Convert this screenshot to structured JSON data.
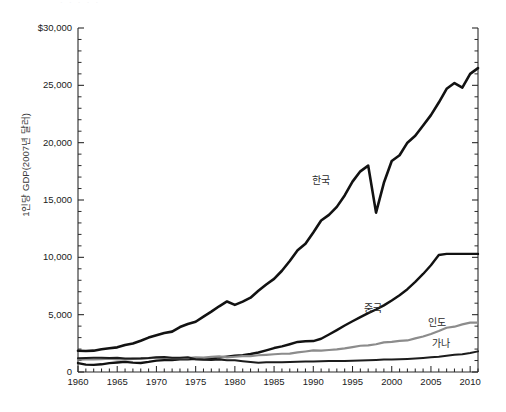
{
  "figure": {
    "cropped_top_text": "· · · · ·",
    "ylabel": "1인당 GDP(2007년 달러)"
  },
  "axes": {
    "y_ticks": [
      "$30,000",
      "25,000",
      "20,000",
      "15,000",
      "10,000",
      "5,000",
      "0"
    ],
    "y_tick_values": [
      30000,
      25000,
      20000,
      15000,
      10000,
      5000,
      0
    ],
    "x_ticks": [
      "1960",
      "1965",
      "1970",
      "1975",
      "1980",
      "1985",
      "1990",
      "1995",
      "2000",
      "2005",
      "2010"
    ],
    "x_tick_values": [
      1960,
      1965,
      1970,
      1975,
      1980,
      1985,
      1990,
      1995,
      2000,
      2005,
      2010
    ]
  },
  "series_labels": [
    {
      "name": "korea",
      "text": "한국",
      "x": 312,
      "y": 172
    },
    {
      "name": "china",
      "text": "중국",
      "x": 364,
      "y": 300
    },
    {
      "name": "india",
      "text": "인도",
      "x": 428,
      "y": 314
    },
    {
      "name": "ghana",
      "text": "가나",
      "x": 432,
      "y": 335
    }
  ],
  "colors": {
    "korea": "#121212",
    "china": "#121212",
    "india": "#8c8c8c",
    "ghana": "#1c1c1c",
    "axis": "#2a2a2a",
    "text": "#1a1a1a",
    "background": "#ffffff"
  },
  "chart_data": {
    "type": "line",
    "title": "",
    "xlabel": "",
    "ylabel": "1인당 GDP(2007년 달러)",
    "xlim": [
      1960,
      2011
    ],
    "ylim": [
      0,
      30000
    ],
    "grid": false,
    "legend": "inline-annotations",
    "x": [
      1960,
      1961,
      1962,
      1963,
      1964,
      1965,
      1966,
      1967,
      1968,
      1969,
      1970,
      1971,
      1972,
      1973,
      1974,
      1975,
      1976,
      1977,
      1978,
      1979,
      1980,
      1981,
      1982,
      1983,
      1984,
      1985,
      1986,
      1987,
      1988,
      1989,
      1990,
      1991,
      1992,
      1993,
      1994,
      1995,
      1996,
      1997,
      1998,
      1999,
      2000,
      2001,
      2002,
      2003,
      2004,
      2005,
      2006,
      2007,
      2008,
      2009,
      2010,
      2011
    ],
    "series": [
      {
        "name": "한국",
        "name_en": "Korea",
        "color": "#121212",
        "values": [
          1850,
          1830,
          1860,
          1990,
          2070,
          2150,
          2360,
          2490,
          2730,
          3000,
          3200,
          3400,
          3520,
          3920,
          4180,
          4380,
          4830,
          5260,
          5730,
          6150,
          5850,
          6140,
          6480,
          7080,
          7630,
          8120,
          8830,
          9680,
          10610,
          11190,
          12170,
          13210,
          13700,
          14400,
          15400,
          16600,
          17500,
          18000,
          13900,
          16500,
          18400,
          18900,
          20000,
          20600,
          21500,
          22400,
          23500,
          24700,
          25200,
          24800,
          26000,
          26500
        ]
      },
      {
        "name": "중국",
        "name_en": "China",
        "color": "#121212",
        "values": [
          780,
          640,
          620,
          670,
          770,
          830,
          880,
          820,
          790,
          880,
          990,
          1040,
          1040,
          1100,
          1100,
          1160,
          1120,
          1170,
          1270,
          1340,
          1420,
          1470,
          1570,
          1700,
          1890,
          2090,
          2230,
          2420,
          2620,
          2680,
          2700,
          2900,
          3270,
          3650,
          4050,
          4420,
          4790,
          5140,
          5450,
          5810,
          6240,
          6700,
          7220,
          7860,
          8550,
          9310,
          10200,
          10300,
          10300,
          10300,
          10300,
          10300
        ]
      },
      {
        "name": "인도",
        "name_en": "India",
        "color": "#8c8c8c",
        "values": [
          1080,
          1090,
          1090,
          1120,
          1170,
          1100,
          1080,
          1140,
          1150,
          1200,
          1260,
          1240,
          1200,
          1220,
          1210,
          1270,
          1260,
          1320,
          1370,
          1270,
          1330,
          1380,
          1390,
          1460,
          1500,
          1550,
          1590,
          1610,
          1710,
          1790,
          1880,
          1860,
          1920,
          1980,
          2060,
          2170,
          2290,
          2320,
          2420,
          2580,
          2630,
          2720,
          2750,
          2930,
          3100,
          3320,
          3570,
          3860,
          3950,
          4150,
          4300,
          4300
        ]
      },
      {
        "name": "가나",
        "name_en": "Ghana",
        "color": "#1c1c1c",
        "values": [
          1200,
          1230,
          1240,
          1250,
          1230,
          1250,
          1180,
          1180,
          1190,
          1220,
          1280,
          1300,
          1240,
          1250,
          1280,
          1110,
          1060,
          1040,
          1090,
          1030,
          1020,
          940,
          870,
          800,
          840,
          850,
          860,
          880,
          900,
          910,
          920,
          930,
          950,
          960,
          970,
          990,
          1010,
          1030,
          1050,
          1080,
          1090,
          1110,
          1140,
          1180,
          1230,
          1280,
          1340,
          1420,
          1500,
          1540,
          1650,
          1800
        ]
      }
    ]
  }
}
